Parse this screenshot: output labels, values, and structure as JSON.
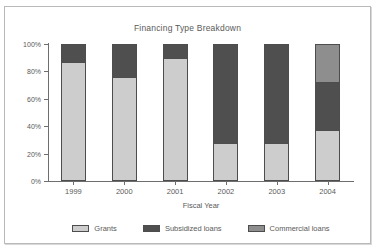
{
  "chart_data": {
    "type": "bar",
    "subtype": "stacked-percentage-column",
    "title": "Financing Type Breakdown",
    "xlabel": "Fiscal Year",
    "ylabel": "",
    "categories": [
      "1999",
      "2000",
      "2001",
      "2002",
      "2003",
      "2004"
    ],
    "ytick_labels": [
      "0%",
      "20%",
      "40%",
      "60%",
      "80%",
      "100%"
    ],
    "ytick_values": [
      0,
      20,
      40,
      60,
      80,
      100
    ],
    "ylim": [
      0,
      100
    ],
    "grid": false,
    "legend_position": "bottom",
    "series": [
      {
        "name": "Grants",
        "color": "#cdcdcd",
        "values": [
          87,
          76,
          90,
          27,
          27,
          37
        ]
      },
      {
        "name": "Subsidized loans",
        "color": "#4f4f4f",
        "values": [
          13,
          24,
          10,
          73,
          73,
          35
        ]
      },
      {
        "name": "Commercial loans",
        "color": "#8e8e8e",
        "values": [
          0,
          0,
          0,
          0,
          0,
          28
        ]
      }
    ]
  },
  "style": {
    "axis_color": "#6e6e6e",
    "text_color": "#5a5a5a",
    "frame_color": "#b9b9b9",
    "background": "#ffffff"
  }
}
